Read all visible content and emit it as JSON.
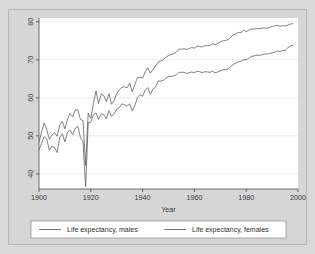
{
  "chart_data": {
    "type": "line",
    "title": "",
    "xlabel": "Year",
    "ylabel": "",
    "xlim": [
      1900,
      2000
    ],
    "ylim": [
      36,
      81
    ],
    "grid": true,
    "legend_position": "bottom",
    "xticks": [
      1900,
      1920,
      1940,
      1960,
      1980,
      2000
    ],
    "xtick_labels": [
      "1900",
      "1920",
      "1940",
      "1960",
      "1980",
      "2000"
    ],
    "yticks": [
      40,
      50,
      60,
      70,
      80
    ],
    "ytick_labels": [
      "40",
      "50",
      "60",
      "70",
      "80"
    ],
    "x": [
      1900,
      1901,
      1902,
      1903,
      1904,
      1905,
      1906,
      1907,
      1908,
      1909,
      1910,
      1911,
      1912,
      1913,
      1914,
      1915,
      1916,
      1917,
      1918,
      1919,
      1920,
      1921,
      1922,
      1923,
      1924,
      1925,
      1926,
      1927,
      1928,
      1929,
      1930,
      1931,
      1932,
      1933,
      1934,
      1935,
      1936,
      1937,
      1938,
      1939,
      1940,
      1941,
      1942,
      1943,
      1944,
      1945,
      1946,
      1947,
      1948,
      1949,
      1950,
      1951,
      1952,
      1953,
      1954,
      1955,
      1956,
      1957,
      1958,
      1959,
      1960,
      1961,
      1962,
      1963,
      1964,
      1965,
      1966,
      1967,
      1968,
      1969,
      1970,
      1971,
      1972,
      1973,
      1974,
      1975,
      1976,
      1977,
      1978,
      1979,
      1980,
      1981,
      1982,
      1983,
      1984,
      1985,
      1986,
      1987,
      1988,
      1989,
      1990,
      1991,
      1992,
      1993,
      1994,
      1995,
      1996,
      1997,
      1998
    ],
    "series": [
      {
        "name": "Life expectancy, males",
        "values": [
          46.3,
          48.0,
          49.8,
          49.1,
          46.2,
          47.3,
          46.9,
          45.6,
          49.5,
          50.5,
          48.4,
          50.9,
          51.5,
          50.3,
          52.0,
          52.5,
          49.6,
          48.4,
          36.6,
          53.5,
          53.6,
          55.6,
          56.0,
          54.3,
          55.8,
          55.6,
          54.5,
          56.6,
          55.1,
          55.8,
          57.0,
          57.4,
          58.4,
          58.2,
          57.8,
          58.4,
          56.6,
          57.9,
          60.1,
          60.8,
          60.4,
          62.0,
          62.7,
          60.9,
          62.3,
          62.8,
          64.4,
          64.4,
          64.6,
          65.2,
          65.6,
          65.6,
          65.8,
          66.0,
          66.7,
          66.7,
          66.7,
          66.4,
          66.6,
          66.8,
          66.6,
          67.0,
          66.9,
          66.6,
          66.9,
          66.8,
          66.7,
          67.0,
          66.6,
          66.8,
          67.1,
          67.4,
          67.4,
          67.6,
          68.2,
          68.8,
          69.1,
          69.5,
          69.6,
          70.0,
          70.0,
          70.4,
          70.9,
          71.0,
          71.2,
          71.2,
          71.3,
          71.5,
          71.5,
          71.7,
          71.8,
          72.0,
          72.3,
          72.2,
          72.4,
          72.5,
          73.1,
          73.6,
          73.8
        ]
      },
      {
        "name": "Life expectancy, females",
        "values": [
          48.3,
          51.0,
          53.4,
          51.6,
          49.1,
          50.2,
          50.8,
          49.9,
          52.8,
          53.8,
          51.8,
          54.4,
          55.9,
          55.0,
          56.8,
          56.8,
          54.3,
          54.0,
          42.2,
          56.0,
          54.6,
          58.5,
          61.8,
          58.5,
          61.0,
          60.6,
          59.0,
          61.1,
          58.3,
          59.3,
          61.1,
          62.1,
          62.8,
          62.9,
          62.6,
          63.9,
          61.6,
          63.5,
          65.3,
          65.4,
          65.2,
          66.8,
          67.9,
          66.5,
          67.4,
          68.4,
          69.4,
          69.7,
          70.0,
          70.7,
          71.1,
          71.4,
          71.6,
          72.0,
          72.8,
          72.8,
          72.9,
          72.7,
          73.0,
          73.2,
          73.1,
          73.6,
          73.5,
          73.4,
          73.7,
          73.7,
          73.8,
          74.2,
          74.0,
          74.3,
          74.7,
          75.0,
          75.1,
          75.3,
          75.9,
          76.6,
          76.8,
          77.2,
          77.2,
          77.8,
          77.4,
          77.8,
          78.1,
          78.1,
          78.2,
          78.2,
          78.3,
          78.4,
          78.3,
          78.5,
          78.8,
          78.9,
          79.1,
          78.8,
          79.0,
          78.9,
          79.1,
          79.4,
          79.5
        ]
      }
    ],
    "annotations": []
  },
  "legend": {
    "entries": [
      {
        "label": "Life expectancy, males"
      },
      {
        "label": "Life expectancy, females"
      }
    ]
  },
  "colors": {
    "figure_background": "#d6d6d6",
    "plot_background": "#ffffff",
    "line": "#55555c",
    "grid": "#e3e3e3",
    "axis": "#4d4d4d",
    "text": "#3a3a3a"
  }
}
